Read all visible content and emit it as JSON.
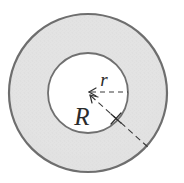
{
  "figure": {
    "name": "annulus-radii-diagram",
    "type": "geometric-diagram",
    "shape": "annulus",
    "background_color": "#ffffff",
    "labels": {
      "inner_radius": "r",
      "outer_radius": "R"
    },
    "geometry": {
      "center_x": 88,
      "center_y": 93,
      "outer_radius_px": 79,
      "inner_radius_px": 40,
      "inner_radius_leader": {
        "from_x": 90,
        "from_y": 92,
        "to_x": 127,
        "to_y": 92,
        "style": "dashed",
        "arrow": "start"
      },
      "outer_radius_leader": {
        "from_x": 90,
        "from_y": 95,
        "to_x": 149,
        "to_y": 148,
        "style": "dashed",
        "arrow": "start"
      },
      "label_r_position": {
        "x": 105,
        "y": 85
      },
      "label_R_position": {
        "x": 74,
        "y": 124
      }
    },
    "colors": {
      "annulus_fill": "#e2e2e2",
      "inner_fill": "#ffffff",
      "outline": "#6e6e6e",
      "inner_outline": "#707070",
      "leader_line": "#3a3a3a",
      "label_text": "#2b2b2b"
    },
    "stroke_widths": {
      "outer_circle": 2.2,
      "inner_circle": 1.8,
      "leader_line": 1.1
    }
  }
}
